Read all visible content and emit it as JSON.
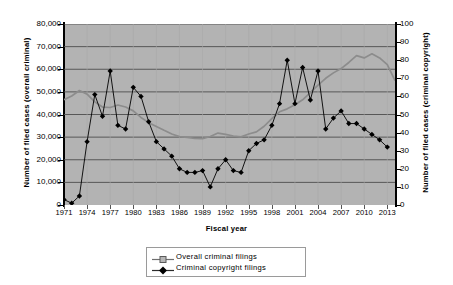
{
  "chart_data": {
    "type": "line",
    "title": "",
    "xlabel": "Fiscal year",
    "ylabel": "Number of filed cases (overall criminal)",
    "ylabel_right": "Number of filed cases (criminal copyright)",
    "ylim": [
      0,
      80000
    ],
    "ylim_right": [
      0,
      100
    ],
    "yticks": [
      "0",
      "10,000",
      "20,000",
      "30,000",
      "40,000",
      "50,000",
      "60,000",
      "70,000",
      "80,000"
    ],
    "ytick_values": [
      0,
      10000,
      20000,
      30000,
      40000,
      50000,
      60000,
      70000,
      80000
    ],
    "yticks_right": [
      "0",
      "10",
      "20",
      "30",
      "40",
      "50",
      "60",
      "70",
      "80",
      "90",
      "100"
    ],
    "ytick_values_right": [
      0,
      10,
      20,
      30,
      40,
      50,
      60,
      70,
      80,
      90,
      100
    ],
    "xticks": [
      "1971",
      "1974",
      "1977",
      "1980",
      "1983",
      "1986",
      "1989",
      "1992",
      "1995",
      "1998",
      "2001",
      "2004",
      "2007",
      "2010",
      "2013"
    ],
    "xlim": [
      1971,
      2014
    ],
    "grid": "horizontal",
    "plot_background": "#b3b3b3",
    "legend_position": "bottom-center",
    "x": [
      1971,
      1972,
      1973,
      1974,
      1975,
      1976,
      1977,
      1978,
      1979,
      1980,
      1981,
      1982,
      1983,
      1984,
      1985,
      1986,
      1987,
      1988,
      1989,
      1990,
      1991,
      1992,
      1993,
      1994,
      1995,
      1996,
      1997,
      1998,
      1999,
      2000,
      2001,
      2002,
      2003,
      2004,
      2005,
      2006,
      2007,
      2008,
      2009,
      2010,
      2011,
      2012,
      2013,
      2014
    ],
    "series": [
      {
        "name": "Overall criminal filings",
        "axis": "left",
        "color": "#8c8c8c",
        "marker": "square",
        "values": [
          46500,
          48200,
          50600,
          49000,
          45600,
          43300,
          43100,
          44200,
          43300,
          41600,
          38700,
          36400,
          34700,
          33000,
          31400,
          30200,
          29900,
          29400,
          29300,
          30300,
          31800,
          31200,
          30500,
          30100,
          31400,
          32300,
          34800,
          38200,
          41200,
          42500,
          44300,
          46500,
          49700,
          53000,
          56000,
          58400,
          60300,
          63000,
          66000,
          65000,
          66800,
          65000,
          62000,
          55000
        ]
      },
      {
        "name": "Criminal copyright filings",
        "axis": "right",
        "color": "#000000",
        "marker": "diamond",
        "values": [
          3,
          1,
          5,
          35,
          61,
          49,
          74,
          44,
          42,
          65,
          60,
          46,
          35,
          31,
          27,
          20,
          18,
          18,
          19,
          10,
          20,
          25,
          19,
          18,
          30,
          34,
          36,
          44,
          56,
          80,
          56,
          76,
          58,
          74,
          42,
          48,
          52,
          45,
          45,
          42,
          39,
          36,
          32,
          null
        ]
      }
    ]
  },
  "legend": {
    "items": [
      {
        "label": "Overall criminal filings",
        "marker": "square",
        "color": "#8c8c8c"
      },
      {
        "label": "Criminal copyright filings",
        "marker": "diamond",
        "color": "#000000"
      }
    ]
  }
}
